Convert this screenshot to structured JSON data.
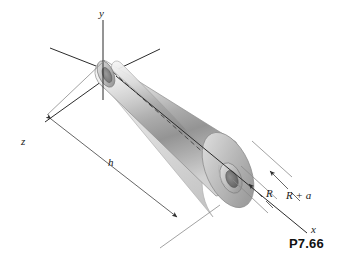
{
  "figure": {
    "number": "P7.66",
    "background_color": "#ffffff",
    "axes": [
      {
        "name": "y-axis",
        "label": "y"
      },
      {
        "name": "z-axis",
        "label": "z"
      },
      {
        "name": "x-axis",
        "label": "x"
      }
    ],
    "dimensions": [
      {
        "name": "height",
        "label": "h"
      },
      {
        "name": "inner-radius",
        "label": "R"
      },
      {
        "name": "outer-radius",
        "label": "R + a"
      }
    ],
    "shape": {
      "name": "truncated-cone-with-cylindrical-bore",
      "surface_light": "#f2f2f2",
      "surface_mid": "#c9c9c9",
      "surface_dark": "#8f8f8f",
      "bore_dark": "#6d6d6d",
      "edge_color": "#8d8d8d",
      "axis_color": "#2b2b2b",
      "dimension_color": "#555555"
    }
  }
}
